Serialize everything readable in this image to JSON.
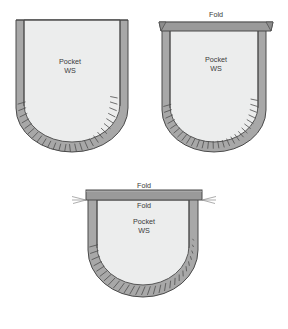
{
  "figure": {
    "caption": "",
    "background_color": "#ffffff",
    "colors": {
      "pocket_body_fill": "#eceded",
      "seam_allowance_fill": "#a8a8a8",
      "fold_bar_fill": "#9a9a9a",
      "outline_stroke": "#4a4a4a",
      "notch_stroke": "#4f4f4f",
      "label_text": "#3a3a3a"
    },
    "panels": [
      {
        "id": "panel-top-left",
        "name": "pocket-step-1",
        "position": {
          "x": 12,
          "y": 14,
          "width": 120,
          "height": 148
        },
        "labels": [
          {
            "name": "pocket-label",
            "text": "Pocket",
            "x": 70,
            "y": 62
          },
          {
            "name": "ws-label",
            "text": "WS",
            "x": 70,
            "y": 71
          }
        ],
        "has_fold_bar": false,
        "fold_labels": []
      },
      {
        "id": "panel-top-right",
        "name": "pocket-step-2",
        "position": {
          "x": 158,
          "y": 14,
          "width": 118,
          "height": 148
        },
        "labels": [
          {
            "name": "pocket-label",
            "text": "Pocket",
            "x": 216,
            "y": 60
          },
          {
            "name": "ws-label",
            "text": "WS",
            "x": 216,
            "y": 69
          }
        ],
        "has_fold_bar": true,
        "fold_labels": [
          {
            "name": "fold-label-top",
            "text": "Fold",
            "x": 216,
            "y": 15
          }
        ]
      },
      {
        "id": "panel-bottom",
        "name": "pocket-step-3",
        "position": {
          "x": 84,
          "y": 184,
          "width": 120,
          "height": 130
        },
        "labels": [
          {
            "name": "pocket-label",
            "text": "Pocket",
            "x": 144,
            "y": 222
          },
          {
            "name": "ws-label",
            "text": "WS",
            "x": 144,
            "y": 231
          }
        ],
        "has_fold_bar": true,
        "fold_labels": [
          {
            "name": "fold-label-upper",
            "text": "Fold",
            "x": 144,
            "y": 186
          },
          {
            "name": "fold-label-lower",
            "text": "Fold",
            "x": 144,
            "y": 206
          }
        ]
      }
    ]
  }
}
